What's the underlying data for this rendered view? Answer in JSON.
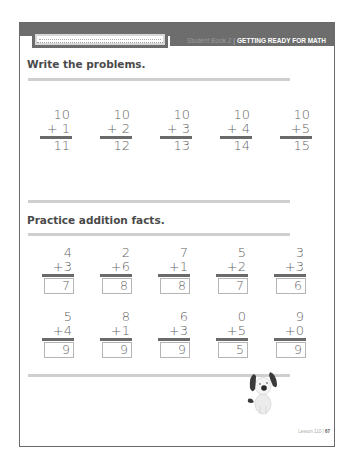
{
  "header": {
    "book": "Student Book 2",
    "separator": "|",
    "subject": "GETTING READY FOR MATH",
    "name_field_placeholder": ""
  },
  "section1": {
    "title": "Write the problems.",
    "problems": [
      {
        "top": "10",
        "add": "+ 1",
        "answer": "11"
      },
      {
        "top": "10",
        "add": "+ 2",
        "answer": "12"
      },
      {
        "top": "10",
        "add": "+ 3",
        "answer": "13"
      },
      {
        "top": "10",
        "add": "+ 4",
        "answer": "14"
      },
      {
        "top": "10",
        "add": "+5",
        "answer": "15"
      }
    ]
  },
  "section2": {
    "title": "Practice addition facts.",
    "row1": [
      {
        "top": "4",
        "add": "+3",
        "answer": "7"
      },
      {
        "top": "2",
        "add": "+6",
        "answer": "8"
      },
      {
        "top": "7",
        "add": "+1",
        "answer": "8"
      },
      {
        "top": "5",
        "add": "+2",
        "answer": "7"
      },
      {
        "top": "3",
        "add": "+3",
        "answer": "6"
      }
    ],
    "row2": [
      {
        "top": "5",
        "add": "+4",
        "answer": "9"
      },
      {
        "top": "8",
        "add": "+1",
        "answer": "9"
      },
      {
        "top": "6",
        "add": "+3",
        "answer": "9"
      },
      {
        "top": "0",
        "add": "+5",
        "answer": "5"
      },
      {
        "top": "9",
        "add": "+0",
        "answer": "9"
      }
    ]
  },
  "illustration": {
    "icon": "dog-icon"
  },
  "footer": {
    "lesson": "Lesson 110",
    "separator": "|",
    "page": "67"
  },
  "colors": {
    "header_band": "#6d6d6d",
    "rule": "#cfcfcf",
    "text": "#4a4a4a"
  }
}
